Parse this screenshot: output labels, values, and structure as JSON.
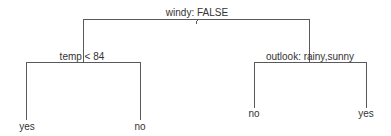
{
  "tree": {
    "root": {
      "label": "windy: FALSE",
      "left": {
        "label": "temp < 84",
        "left": {
          "label": "yes"
        },
        "right": {
          "label": "no"
        }
      },
      "right": {
        "label": "outlook: rainy,sunny",
        "left": {
          "label": "no"
        },
        "right": {
          "label": "yes"
        }
      }
    }
  },
  "colors": {
    "line": "#5a5a5a",
    "text": "#333333",
    "background": "#ffffff"
  }
}
